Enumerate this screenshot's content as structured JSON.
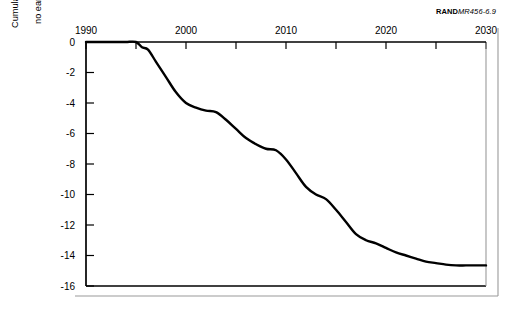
{
  "figure": {
    "source_tag": {
      "brand": "RAND",
      "code": "MR456-6.9"
    },
    "ylabel_line1": "Cumulative cost of early decommissioning relative to",
    "ylabel_line2": "no early decommissioning (billions of 1993 dollars)"
  },
  "chart_data": {
    "type": "line",
    "title": "",
    "subtitle": "",
    "xlabel": "",
    "ylabel": "Cumulative cost of early decommissioning relative to no early decommissioning (billions of 1993 dollars)",
    "xlim": [
      1990,
      2030
    ],
    "ylim": [
      -16,
      0
    ],
    "xticks": [
      1990,
      1995,
      2000,
      2005,
      2010,
      2015,
      2020,
      2025,
      2030
    ],
    "xtick_labels": [
      "1990",
      "",
      "2000",
      "",
      "2010",
      "",
      "2020",
      "",
      "2030"
    ],
    "xtick_labels_shown": [
      "1990",
      "2000",
      "2010",
      "2020",
      "2030"
    ],
    "yticks": [
      0,
      -2,
      -4,
      -6,
      -8,
      -10,
      -12,
      -14,
      -16
    ],
    "ytick_labels": [
      "0",
      "-2",
      "-4",
      "-6",
      "-8",
      "-10",
      "-12",
      "-14",
      "-16"
    ],
    "x_axis_position": "top",
    "y_axis_position": "left",
    "grid": false,
    "legend": false,
    "legend_position": "none",
    "line_color": "#000000",
    "series": [
      {
        "name": "Cumulative cost of early decommissioning",
        "x": [
          1990,
          1991,
          1992,
          1993,
          1994,
          1995,
          1995.6,
          1996.2,
          1997,
          1998,
          1999,
          2000,
          2001,
          2002,
          2003,
          2004,
          2005,
          2006,
          2007,
          2008,
          2009,
          2010,
          2011,
          2012,
          2013,
          2014,
          2015,
          2016,
          2017,
          2018,
          2019,
          2020,
          2021,
          2022,
          2023,
          2024,
          2025,
          2026,
          2027,
          2028,
          2029,
          2030
        ],
        "values": [
          0.0,
          0.0,
          0.0,
          0.0,
          0.0,
          0.0,
          -0.35,
          -0.5,
          -1.3,
          -2.3,
          -3.3,
          -4.0,
          -4.3,
          -4.5,
          -4.6,
          -5.1,
          -5.7,
          -6.3,
          -6.7,
          -7.0,
          -7.1,
          -7.7,
          -8.6,
          -9.5,
          -10.0,
          -10.3,
          -11.0,
          -11.8,
          -12.6,
          -13.0,
          -13.2,
          -13.5,
          -13.8,
          -14.0,
          -14.2,
          -14.4,
          -14.5,
          -14.6,
          -14.65,
          -14.65,
          -14.65,
          -14.65
        ]
      }
    ],
    "annotations": [
      {
        "text": "RAND MR456-6.9",
        "position": "top-right"
      }
    ]
  }
}
